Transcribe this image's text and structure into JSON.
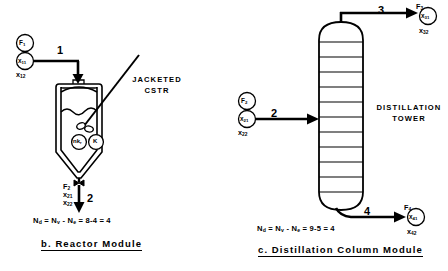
{
  "figure": {
    "panels": [
      {
        "id": "reactor",
        "caption": "b. Reactor Module",
        "equipment_label_line1": "JACKETED",
        "equipment_label_line2": "CSTR",
        "degrees_of_freedom_equation": "Nₐ = Nᵥ - Nₑ = 8-4 = 4",
        "equation_parts": {
          "Nd": "N",
          "Nd_sub": "d",
          "Nv": "N",
          "Nv_sub": "v",
          "Ne": "N",
          "Ne_sub": "e",
          "Nv_value": "8",
          "Ne_value": "4",
          "result": "4"
        },
        "inlet_stream": {
          "number": "1",
          "flow_symbol": "F",
          "flow_sub": "1",
          "comp_symbol": "x",
          "comp_sub": "11",
          "comp2_symbol": "x",
          "comp2_sub": "12"
        },
        "outlet_stream": {
          "number": "2",
          "flow_symbol": "F",
          "flow_sub": "2",
          "comp_symbol": "x",
          "comp_sub": "21",
          "comp2_symbol": "x",
          "comp2_sub": "22"
        },
        "internal_tags": [
          {
            "symbol": "nk",
            "sub": "r"
          },
          {
            "symbol": "K",
            "sub": ""
          }
        ],
        "features": [
          "agitator-shaft",
          "impeller",
          "liquid-level",
          "jacket",
          "feed-nozzle",
          "bottom-drain-valve"
        ]
      },
      {
        "id": "distillation",
        "caption": "c. Distillation Column Module",
        "equipment_label_line1": "DISTILLATION",
        "equipment_label_line2": "TOWER",
        "degrees_of_freedom_equation": "Nₐ = Nᵥ - Nₑ = 9-5 = 4",
        "equation_parts": {
          "Nd": "N",
          "Nd_sub": "d",
          "Nv": "N",
          "Nv_sub": "v",
          "Ne": "N",
          "Ne_sub": "e",
          "Nv_value": "9",
          "Ne_value": "5",
          "result": "4"
        },
        "feed_stream": {
          "number": "2",
          "flow_symbol": "F",
          "flow_sub": "2",
          "comp_symbol": "x",
          "comp_sub": "21",
          "comp2_symbol": "x",
          "comp2_sub": "22"
        },
        "overhead_stream": {
          "number": "3",
          "flow_symbol": "F",
          "flow_sub": "3",
          "comp_symbol": "x",
          "comp_sub": "31",
          "comp2_symbol": "x",
          "comp2_sub": "32"
        },
        "bottoms_stream": {
          "number": "4",
          "flow_symbol": "F",
          "flow_sub": "4",
          "comp_symbol": "x",
          "comp_sub": "41",
          "comp2_symbol": "x",
          "comp2_sub": "42"
        },
        "tray_count": 11
      }
    ],
    "colors": {
      "ink": "#000000",
      "background": "#ffffff"
    }
  }
}
